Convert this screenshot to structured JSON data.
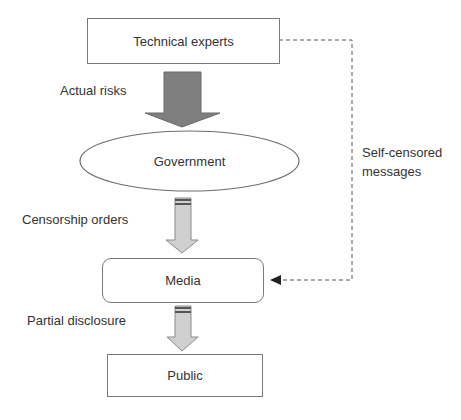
{
  "diagram": {
    "nodes": {
      "technical_experts": "Technical experts",
      "government": "Government",
      "media": "Media",
      "public": "Public"
    },
    "edges": {
      "experts_to_government": "Actual risks",
      "government_to_media": "Censorship orders",
      "media_to_public": "Partial disclosure",
      "experts_to_media_line1": "Self-censored",
      "experts_to_media_line2": "messages"
    },
    "colors": {
      "border": "#7a7a7a",
      "big_arrow_fill": "#7f7f7f",
      "small_arrow_fill": "#d0d0d0",
      "text": "#333333"
    }
  }
}
